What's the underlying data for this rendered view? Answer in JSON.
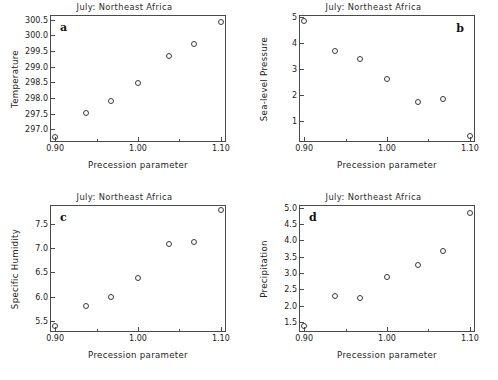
{
  "figure": {
    "shared_title": "July: Northeast Africa",
    "shared_xlabel": "Precession parameter",
    "marker_style": "open-circle",
    "marker_color": "#3a3a3a",
    "axis_color": "#4a4a4a",
    "background": "#ffffff"
  },
  "chart_data": [
    {
      "type": "scatter",
      "panel": "a",
      "title": "July: Northeast Africa",
      "xlabel": "Precession parameter",
      "ylabel": "Temperature",
      "x": [
        0.9,
        0.937,
        0.967,
        1.0,
        1.037,
        1.067,
        1.1
      ],
      "values": [
        296.75,
        297.53,
        297.9,
        298.47,
        299.33,
        299.72,
        300.42
      ],
      "xlim": [
        0.895,
        1.105
      ],
      "ylim": [
        296.62,
        300.62
      ],
      "xticks": [
        0.9,
        1.0,
        1.1
      ],
      "xtick_labels": [
        "0.90",
        "1.00",
        "1.10"
      ],
      "xticks_minor": [
        0.95,
        1.05
      ],
      "yticks": [
        297.0,
        297.5,
        298.0,
        298.5,
        299.0,
        299.5,
        300.0,
        300.5
      ],
      "ytick_labels": [
        "297.0",
        "297.5",
        "298.0",
        "298.5",
        "299.0",
        "299.5",
        "300.0",
        "300.5"
      ],
      "grid": false,
      "legend": false
    },
    {
      "type": "scatter",
      "panel": "b",
      "title": "July: Northeast Africa",
      "xlabel": "Precession parameter",
      "ylabel": "Sea-level Pressure",
      "x": [
        0.9,
        0.937,
        0.967,
        1.0,
        1.037,
        1.067,
        1.1
      ],
      "values": [
        4.87,
        3.7,
        3.4,
        2.61,
        1.71,
        1.83,
        0.4
      ],
      "xlim": [
        0.895,
        1.105
      ],
      "ylim": [
        0.22,
        5.05
      ],
      "xticks": [
        0.9,
        1.0,
        1.1
      ],
      "xtick_labels": [
        "0.90",
        "1.00",
        "1.10"
      ],
      "xticks_minor": [
        0.95,
        1.05
      ],
      "yticks": [
        1,
        2,
        3,
        4,
        5
      ],
      "ytick_labels": [
        "1",
        "2",
        "3",
        "4",
        "5"
      ],
      "grid": false,
      "legend": false
    },
    {
      "type": "scatter",
      "panel": "c",
      "title": "July: Northeast Africa",
      "xlabel": "Precession parameter",
      "ylabel": "Specific Humidity",
      "x": [
        0.9,
        0.937,
        0.967,
        1.0,
        1.037,
        1.067,
        1.1
      ],
      "values": [
        5.4,
        5.82,
        6.0,
        6.38,
        7.08,
        7.12,
        7.77
      ],
      "xlim": [
        0.895,
        1.105
      ],
      "ylim": [
        5.3,
        7.86
      ],
      "xticks": [
        0.9,
        1.0,
        1.1
      ],
      "xtick_labels": [
        "0.90",
        "1.00",
        "1.10"
      ],
      "xticks_minor": [
        0.95,
        1.05
      ],
      "yticks": [
        5.5,
        6.0,
        6.5,
        7.0,
        7.5
      ],
      "ytick_labels": [
        "5.5",
        "6.0",
        "6.5",
        "7.0",
        "7.5"
      ],
      "grid": false,
      "legend": false
    },
    {
      "type": "scatter",
      "panel": "d",
      "title": "July: Northeast Africa",
      "xlabel": "Precession parameter",
      "ylabel": "Precipitation",
      "x": [
        0.9,
        0.937,
        0.967,
        1.0,
        1.037,
        1.067,
        1.1
      ],
      "values": [
        1.37,
        2.29,
        2.24,
        2.86,
        3.25,
        3.66,
        4.85
      ],
      "xlim": [
        0.895,
        1.105
      ],
      "ylim": [
        1.22,
        5.05
      ],
      "xticks": [
        0.9,
        1.0,
        1.1
      ],
      "xtick_labels": [
        "0.90",
        "1.00",
        "1.10"
      ],
      "xticks_minor": [
        0.95,
        1.05
      ],
      "yticks": [
        1.5,
        2.0,
        2.5,
        3.0,
        3.5,
        4.0,
        4.5,
        5.0
      ],
      "ytick_labels": [
        "1.5",
        "2.0",
        "2.5",
        "3.0",
        "3.5",
        "4.0",
        "4.5",
        "5.0"
      ],
      "grid": false,
      "legend": false
    }
  ],
  "panel_letters": {
    "a": "a",
    "b": "b",
    "c": "c",
    "d": "d"
  }
}
